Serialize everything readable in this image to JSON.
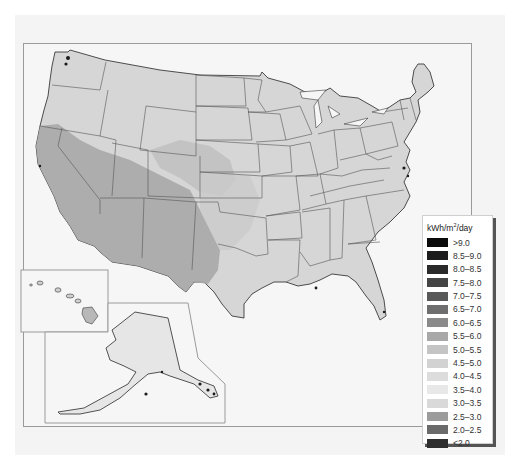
{
  "map": {
    "title": "Solar resource, United States",
    "regions": [
      "contiguous-us",
      "alaska-inset",
      "hawaii-inset"
    ],
    "colors": {
      "background": "#f4f4f4",
      "land_base": "#d6d6d6",
      "southwest_high": "#a9a9a9",
      "state_border": "#555555",
      "coast_dark": "#1a1a1a"
    }
  },
  "legend": {
    "title_prefix": "kWh/m",
    "title_sup": "2",
    "title_suffix": "/day",
    "items": [
      {
        "label": ">9.0",
        "color": "#0a0a0a"
      },
      {
        "label": "8.5–9.0",
        "color": "#1c1c1c"
      },
      {
        "label": "8.0–8.5",
        "color": "#2a2a2a"
      },
      {
        "label": "7.5–8.0",
        "color": "#444444"
      },
      {
        "label": "7.0–7.5",
        "color": "#585858"
      },
      {
        "label": "6.5–7.0",
        "color": "#6e6e6e"
      },
      {
        "label": "6.0–6.5",
        "color": "#8a8a8a"
      },
      {
        "label": "5.5–6.0",
        "color": "#a8a8a8"
      },
      {
        "label": "5.0–5.5",
        "color": "#c4c4c4"
      },
      {
        "label": "4.5–5.0",
        "color": "#d2d2d2"
      },
      {
        "label": "4.0–4.5",
        "color": "#dcdcdc"
      },
      {
        "label": "3.5–4.0",
        "color": "#e8e8e8"
      },
      {
        "label": "3.0–3.5",
        "color": "#d9d9d9"
      },
      {
        "label": "2.5–3.0",
        "color": "#9c9c9c"
      },
      {
        "label": "2.0–2.5",
        "color": "#6a6a6a"
      },
      {
        "label": "<2.0",
        "color": "#2e2e2e"
      }
    ]
  }
}
